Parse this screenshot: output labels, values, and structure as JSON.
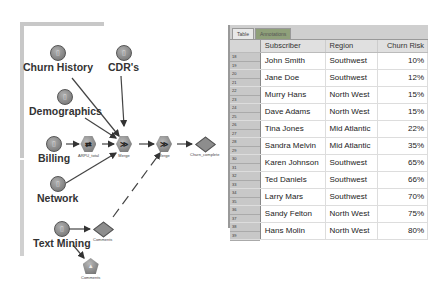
{
  "stream": {
    "sources": [
      {
        "id": "churn_history",
        "label": "Churn History"
      },
      {
        "id": "cdrs",
        "label": "CDR's"
      },
      {
        "id": "demographics",
        "label": "Demographics"
      },
      {
        "id": "billing",
        "label": "Billing"
      },
      {
        "id": "network",
        "label": "Network"
      },
      {
        "id": "text_mining",
        "label": "Text Mining"
      }
    ],
    "nodes": {
      "arpu": "ARPU_total",
      "merge1": "Merge",
      "merge2": "Merge",
      "churn_complete": "Churn_complete",
      "comments_model": "Comments",
      "comments_graph": "Comments"
    }
  },
  "table": {
    "tabs": [
      {
        "label": "Table",
        "active": true
      },
      {
        "label": "Annotations",
        "active": false
      }
    ],
    "columns": [
      "Subscriber",
      "Region",
      "Churn Risk"
    ],
    "rows": [
      {
        "nums": [
          "18",
          "19"
        ],
        "subscriber": "John Smith",
        "region": "Southwest",
        "churn": "10%"
      },
      {
        "nums": [
          "20",
          "21"
        ],
        "subscriber": "Jane Doe",
        "region": "Southwest",
        "churn": "12%"
      },
      {
        "nums": [
          "22",
          "23"
        ],
        "subscriber": "Murry Hans",
        "region": "North West",
        "churn": "15%"
      },
      {
        "nums": [
          "24",
          "25"
        ],
        "subscriber": "Dave Adams",
        "region": "North West",
        "churn": "15%"
      },
      {
        "nums": [
          "26",
          "27"
        ],
        "subscriber": "Tina Jones",
        "region": "Mid Atlantic",
        "churn": "22%"
      },
      {
        "nums": [
          "28",
          "29"
        ],
        "subscriber": "Sandra Melvin",
        "region": "Mid Atlantic",
        "churn": "35%"
      },
      {
        "nums": [
          "30",
          "31"
        ],
        "subscriber": "Karen Johnson",
        "region": "Southwest",
        "churn": "65%"
      },
      {
        "nums": [
          "32",
          "33"
        ],
        "subscriber": "Ted Daniels",
        "region": "Southwest",
        "churn": "66%"
      },
      {
        "nums": [
          "34",
          "35"
        ],
        "subscriber": "Larry Mars",
        "region": "Southwest",
        "churn": "70%"
      },
      {
        "nums": [
          "36",
          "37"
        ],
        "subscriber": "Sandy Felton",
        "region": "North West",
        "churn": "75%"
      },
      {
        "nums": [
          "38",
          "39"
        ],
        "subscriber": "Hans Molin",
        "region": "North West",
        "churn": "80%"
      }
    ]
  }
}
